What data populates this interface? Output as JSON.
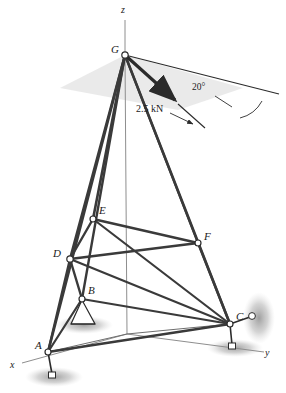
{
  "figure": {
    "kind": "engineering-statics-space-truss"
  },
  "axes": [
    {
      "name": "z-axis",
      "label": "z",
      "x": 121,
      "y": 7
    },
    {
      "name": "x-axis",
      "label": "x",
      "x": 10,
      "y": 361
    },
    {
      "name": "y-axis",
      "label": "y",
      "x": 265,
      "y": 349
    }
  ],
  "nodes": [
    {
      "id": "G",
      "label": "G",
      "cx": 125.0,
      "cy": 55.0,
      "lx": 111,
      "ly": 45,
      "r": 3.2
    },
    {
      "id": "E",
      "label": "E",
      "cx": 93.0,
      "cy": 219.0,
      "lx": 99,
      "ly": 206,
      "r": 3.0
    },
    {
      "id": "F",
      "label": "F",
      "cx": 198.0,
      "cy": 243.0,
      "lx": 204,
      "ly": 232,
      "r": 3.0
    },
    {
      "id": "D",
      "label": "D",
      "cx": 70.0,
      "cy": 259.0,
      "lx": 54,
      "ly": 249,
      "r": 3.2
    },
    {
      "id": "B",
      "label": "B",
      "cx": 82.0,
      "cy": 299.0,
      "lx": 88,
      "ly": 286,
      "r": 3.0
    },
    {
      "id": "A",
      "label": "A",
      "cx": 48.0,
      "cy": 352.0,
      "lx": 36,
      "ly": 341,
      "r": 3.0
    },
    {
      "id": "C",
      "label": "C",
      "cx": 230.0,
      "cy": 324.0,
      "lx": 236,
      "ly": 312,
      "r": 3.0
    }
  ],
  "origin": {
    "name": "origin-O",
    "cx": 127.0,
    "cy": 334.0
  },
  "members": [
    {
      "from": "G",
      "to": "D",
      "width": 2.6
    },
    {
      "from": "G",
      "to": "E",
      "width": 2.6
    },
    {
      "from": "G",
      "to": "B",
      "width": 2.4
    },
    {
      "from": "G",
      "to": "A",
      "width": 2.6
    },
    {
      "from": "G",
      "to": "C",
      "width": 2.6
    },
    {
      "from": "G",
      "to": "F",
      "width": 2.2
    },
    {
      "from": "D",
      "to": "E",
      "width": 2.4
    },
    {
      "from": "E",
      "to": "F",
      "width": 2.4
    },
    {
      "from": "D",
      "to": "F",
      "width": 2.4
    },
    {
      "from": "D",
      "to": "B",
      "width": 2.4
    },
    {
      "from": "D",
      "to": "A",
      "width": 2.4
    },
    {
      "from": "D",
      "to": "C",
      "width": 2.2
    },
    {
      "from": "E",
      "to": "C",
      "width": 2.2
    },
    {
      "from": "F",
      "to": "C",
      "width": 2.4
    },
    {
      "from": "B",
      "to": "C",
      "width": 2.2
    },
    {
      "from": "B",
      "to": "A",
      "width": 2.2
    },
    {
      "from": "A",
      "to": "C",
      "width": 2.4
    }
  ],
  "force": {
    "name": "applied-load",
    "magnitude_label": "2.5 kN",
    "angle_label": "20°",
    "tail": {
      "x": 125.0,
      "y": 55.0
    },
    "head": {
      "x": 179.0,
      "y": 104.0
    },
    "leader_end": {
      "x": 204.0,
      "y": 128.0
    },
    "magnitude_label_pos": {
      "x": 139,
      "y": 110
    },
    "angle_label_pos": {
      "x": 194,
      "y": 88
    }
  },
  "reference_line": {
    "name": "horizontal-reference-line",
    "from": {
      "x": 125.0,
      "y": 55.0
    },
    "to": {
      "x": 279.0,
      "y": 94.0
    }
  },
  "shaded_plane": {
    "name": "horizontal-plane-through-G",
    "points": "60,88 125,55 243,88 178,110",
    "fill": "#e6e6e6"
  },
  "supports": [
    {
      "id": "A-anchor",
      "type": "ground-anchor",
      "node": "A",
      "pin": {
        "x": 48.0,
        "y": 352.0
      },
      "pad": {
        "x": 52.0,
        "y": 375.0
      },
      "ellipse": {
        "cx": 54,
        "cy": 377,
        "rx": 28,
        "ry": 10
      }
    },
    {
      "id": "B-support",
      "type": "cone-pin-support",
      "node": "B",
      "cone": "82,299 71,325 95,325",
      "ellipse": {
        "cx": 83,
        "cy": 326,
        "rx": 28,
        "ry": 9
      }
    },
    {
      "id": "C-anchor-lower",
      "type": "ground-anchor",
      "node": "C",
      "pin": {
        "x": 230.0,
        "y": 324.0
      },
      "pad": {
        "x": 233.0,
        "y": 346.0
      },
      "ellipse": {
        "cx": 234,
        "cy": 348,
        "rx": 27,
        "ry": 9
      }
    },
    {
      "id": "C-anchor-side",
      "type": "ground-anchor",
      "node": "C",
      "pin": {
        "x": 230.0,
        "y": 324.0
      },
      "pad": {
        "x": 253.0,
        "y": 317.0
      },
      "ellipse": {
        "cx": 259,
        "cy": 318,
        "rx": 16,
        "ry": 26
      }
    }
  ],
  "colors": {
    "member": "#3a3a3a",
    "thin_line": "#4a4a4a",
    "axis": "#8c8c8c",
    "shade": "#e3e3e3",
    "ground_shadow": "#b5b5b5",
    "node_fill": "#ffffff",
    "text": "#1a1a1a"
  }
}
